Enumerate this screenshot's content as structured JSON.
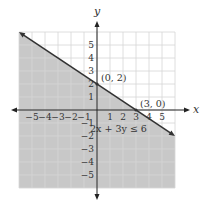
{
  "chart_data": {
    "type": "area",
    "title": "",
    "xlabel": "x",
    "ylabel": "y",
    "xlim": [
      -6,
      6
    ],
    "ylim": [
      -6,
      6
    ],
    "grid": true,
    "x_ticks": [
      "-5",
      "-4",
      "-3",
      "-2",
      "-1",
      "1",
      "2",
      "3",
      "4",
      "5"
    ],
    "y_ticks": [
      "5",
      "4",
      "3",
      "2",
      "1",
      "-1",
      "-2",
      "-3",
      "-4",
      "-5"
    ],
    "boundary_line": {
      "equation": "2x + 3y = 6",
      "style": "solid",
      "x": [
        -6,
        6
      ],
      "y": [
        6,
        -2
      ]
    },
    "shaded_region": "below line",
    "inequality_label": "2x + 3y ≤ 6",
    "points": [
      {
        "label": "(0, 2)",
        "x": 0,
        "y": 2
      },
      {
        "label": "(3, 0)",
        "x": 3,
        "y": 0
      }
    ],
    "colors": {
      "shade": "#c8c8c8",
      "grid": "#d6d6d6",
      "line": "#333333",
      "axis": "#222222"
    }
  }
}
